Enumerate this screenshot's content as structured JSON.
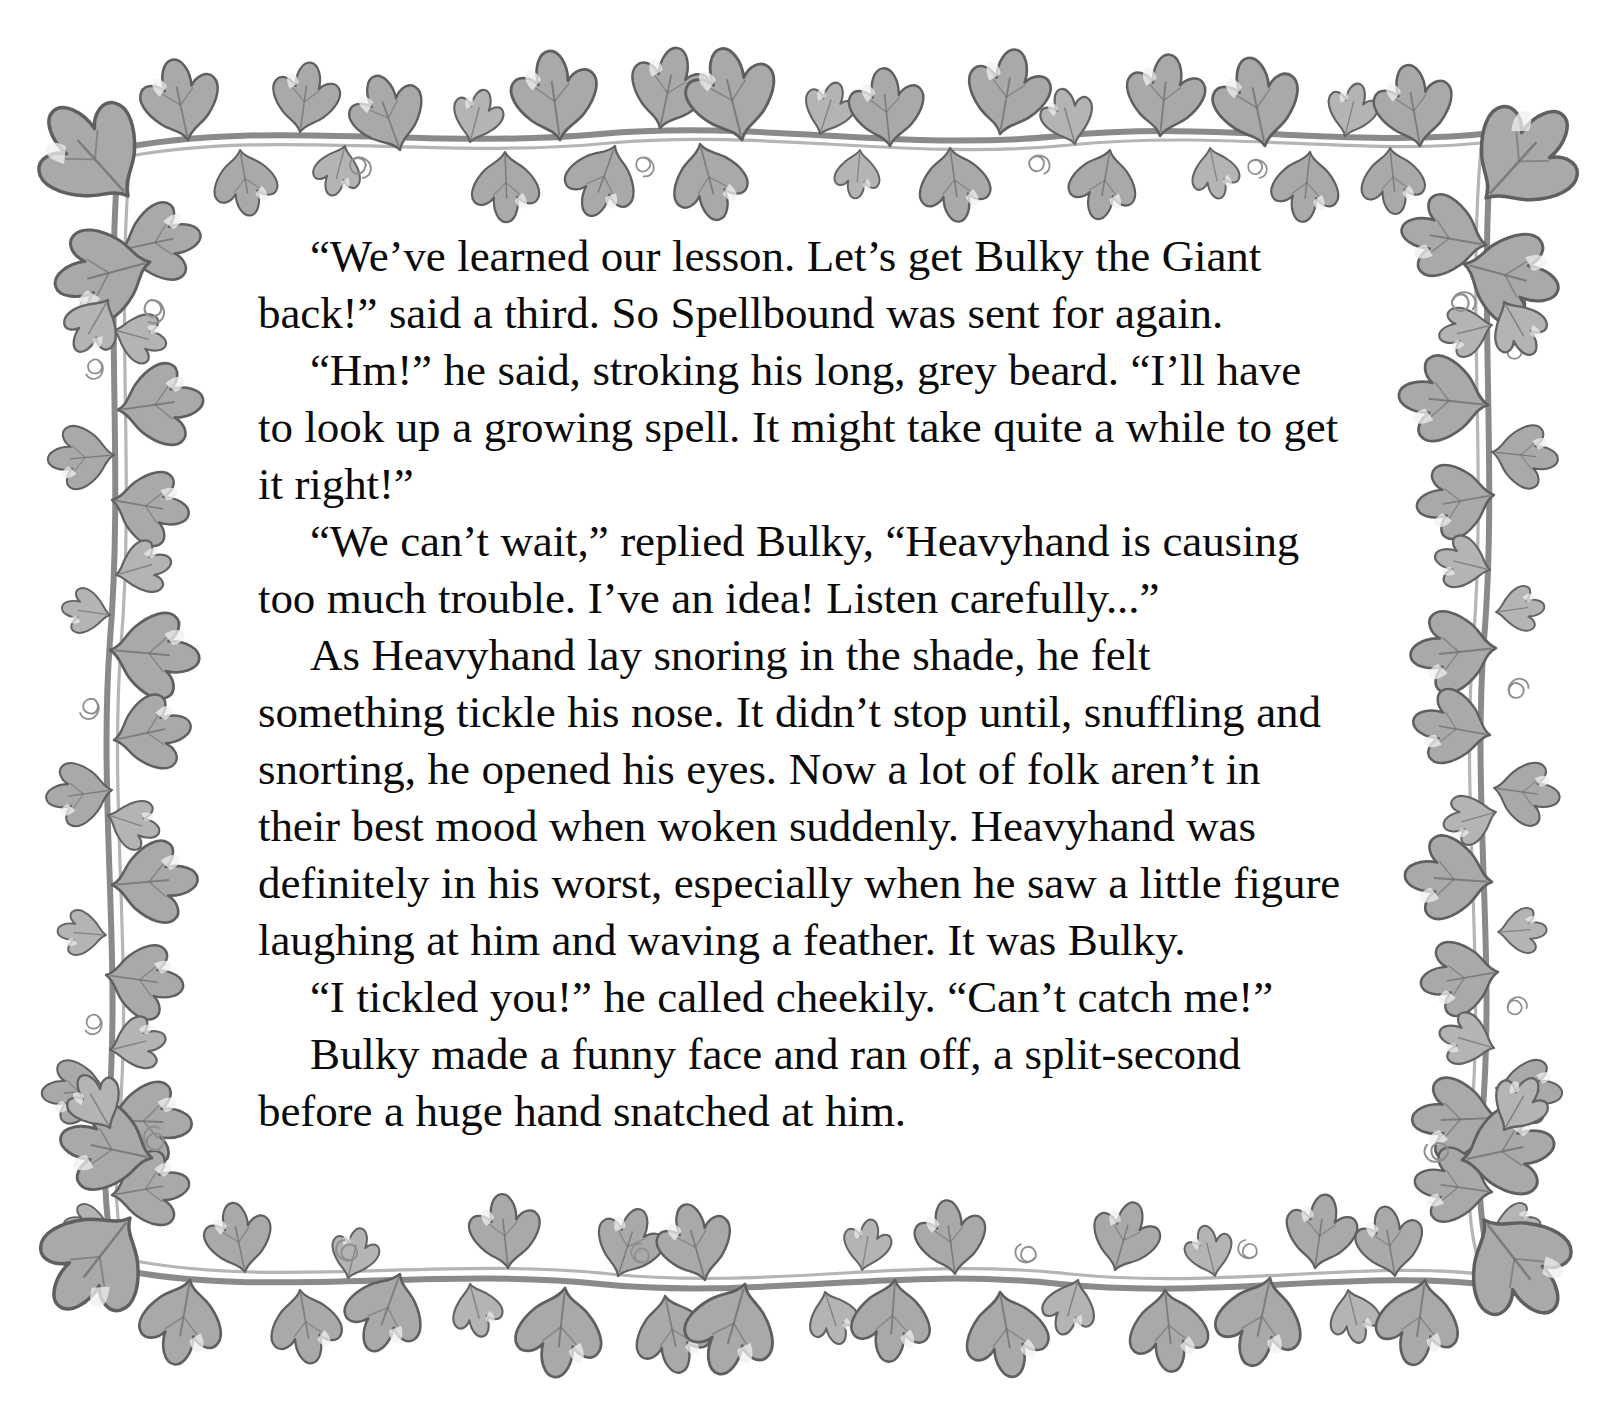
{
  "page": {
    "background_color": "#ffffff",
    "text_color": "#0b0b0b",
    "border_motif": "ivy-vine-border",
    "border_colors": {
      "leaf_fill": "#a9a9a9",
      "leaf_fill_light": "#c3c3c3",
      "leaf_outline": "#5f5f5f",
      "stem": "#8a8a8a",
      "highlight": "#f2f2f2"
    }
  },
  "story": {
    "paragraphs": [
      "“We’ve learned our lesson. Let’s get Bulky the Giant back!” said a third. So Spellbound was sent for again.",
      "“Hm!” he said, stroking his long, grey beard. “I’ll have to look up a growing spell. It might take quite a while to get it right!”",
      "“We can’t wait,” replied Bulky, “Heavyhand is causing too much trouble. I’ve an idea! Listen carefully...”",
      "As Heavyhand lay snoring in the shade, he felt something tickle his nose. It didn’t stop until, snuffling and snorting, he opened his eyes. Now a lot of folk aren’t in their best mood when woken suddenly. Heavyhand was definitely in his worst, especially when he saw a little figure laughing at him and waving a feather. It was Bulky.",
      "“I tickled you!” he called cheekily. “Can’t catch me!”",
      "Bulky made a funny face and ran off, a split-second before a huge hand snatched at him."
    ]
  }
}
